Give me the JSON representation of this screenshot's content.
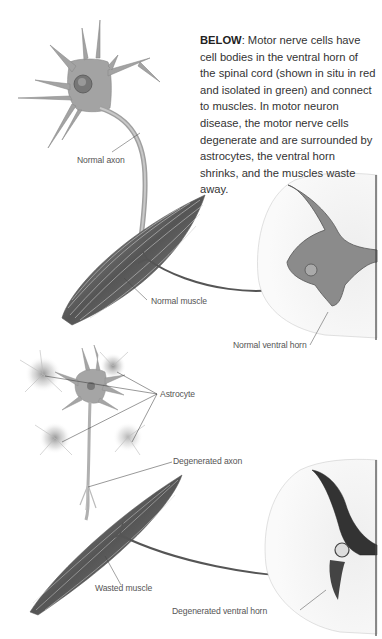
{
  "caption": {
    "lead": "BELOW",
    "text": ": Motor nerve cells have cell bodies in the ventral horn of the spinal cord (shown in situ in red and isolated in green) and connect to muscles. In motor neuron disease, the motor nerve cells degenerate and are surrounded by astrocytes, the ventral horn shrinks, and the muscles waste away."
  },
  "labels": {
    "normal_axon": "Normal axon",
    "normal_muscle": "Normal muscle",
    "normal_ventral_horn": "Normal ventral horn",
    "astrocyte": "Astrocyte",
    "degenerated_axon": "Degenerated axon",
    "wasted_muscle": "Wasted muscle",
    "degenerated_ventral_horn": "Degenerated ventral horn"
  },
  "colors": {
    "neuron": "#9a9a9a",
    "muscle": "#6e6e6e",
    "cord_gray": "#7a7a7a",
    "label_text": "#555555",
    "leader_line": "#444444"
  }
}
